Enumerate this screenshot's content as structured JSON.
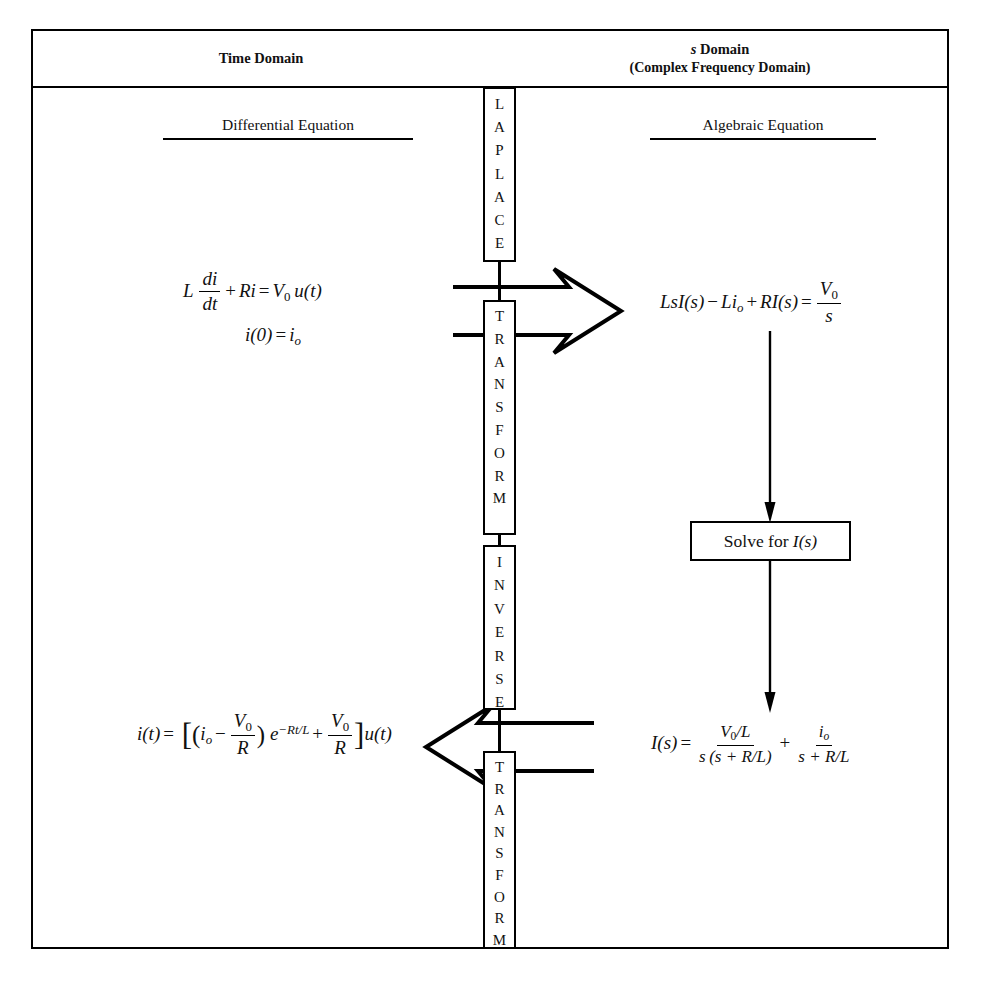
{
  "diagram": {
    "header": {
      "left": "Time Domain",
      "right_line1_italic": "s",
      "right_line1_rest": " Domain",
      "right_line2": "(Complex Frequency Domain)"
    },
    "subheadings": {
      "left": "Differential Equation",
      "right": "Algebraic Equation"
    },
    "center_labels": {
      "laplace": "LAPLACE",
      "transform_top": "TRANSFORM",
      "inverse": "INVERSE",
      "transform_bottom": "TRANSFORM"
    },
    "equations": {
      "differential_line1": "L di/dt + Ri = V₀u(t)",
      "differential_line2": "i(0) = iₒ",
      "algebraic": "LsI(s) − Liₒ + RI(s) = V₀/s",
      "solved_s_domain": "I(s) = (V₀/L)/(s(s + R/L)) + iₒ/(s + R/L)",
      "solved_time_domain": "i(t) = [(iₒ − V₀/R) e^(−Rt/L) + V₀/R] u(t)"
    },
    "solve_box": {
      "text_prefix": "Solve for ",
      "text_symbol": "I",
      "text_suffix": "(s)"
    },
    "symbols": {
      "L": "L",
      "R": "R",
      "i": "i",
      "s": "s",
      "t": "t",
      "u": "u",
      "I": "I",
      "V": "V",
      "e": "e",
      "zero": "0",
      "sub_o": "o",
      "paren_open": "(",
      "paren_close": ")",
      "bracket_open": "[",
      "bracket_close": "]",
      "plus": "+",
      "minus": "−",
      "equals": "=",
      "slash": "/",
      "d": "d"
    },
    "colors": {
      "line": "#000000",
      "background": "#ffffff",
      "text": "#111111"
    }
  }
}
